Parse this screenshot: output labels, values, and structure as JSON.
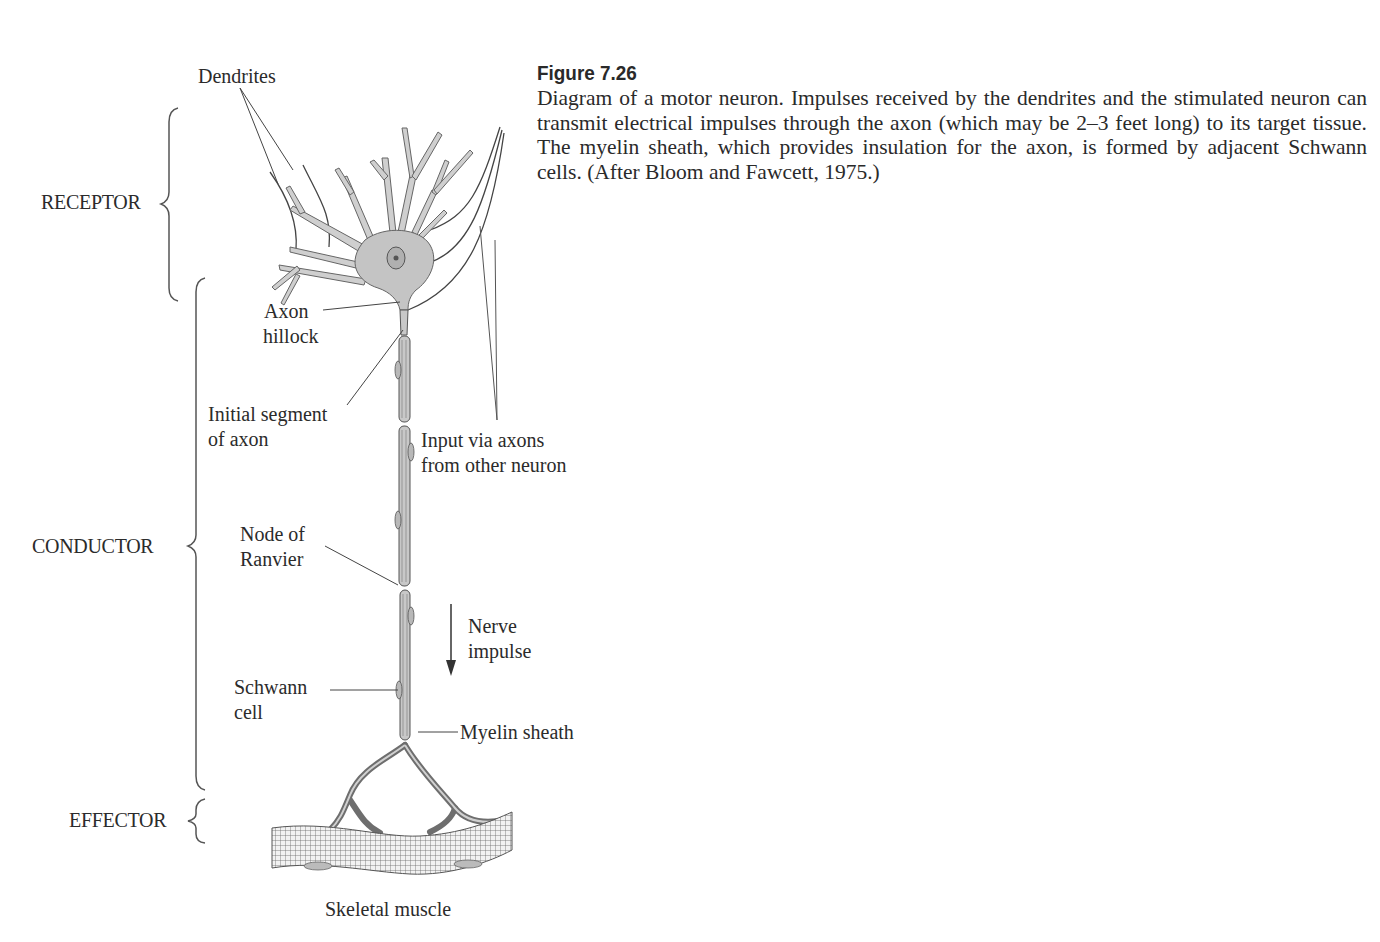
{
  "caption": {
    "title": "Figure 7.26",
    "body": "Diagram of a motor neuron. Impulses received by the dendrites and the stimulated neuron can transmit electrical impulses through the axon (which may be 2–3 feet long) to its target tissue. The myelin sheath, which provides insulation for the axon, is formed by adjacent Schwann cells. (After Bloom and Fawcett, 1975.)"
  },
  "sections": {
    "receptor": "RECEPTOR",
    "conductor": "CONDUCTOR",
    "effector": "EFFECTOR"
  },
  "labels": {
    "dendrites": "Dendrites",
    "axon_hillock_1": "Axon",
    "axon_hillock_2": "hillock",
    "initial_segment_1": "Initial segment",
    "initial_segment_2": "of axon",
    "input_1": "Input via axons",
    "input_2": "from other neuron",
    "node_1": "Node of",
    "node_2": "Ranvier",
    "nerve_1": "Nerve",
    "nerve_2": "impulse",
    "schwann_1": "Schwann",
    "schwann_2": "cell",
    "myelin": "Myelin sheath",
    "muscle": "Skeletal muscle"
  },
  "colors": {
    "ink": "#2b2b2b",
    "cell_fill": "#c8c8c8",
    "cell_stroke": "#555555"
  }
}
